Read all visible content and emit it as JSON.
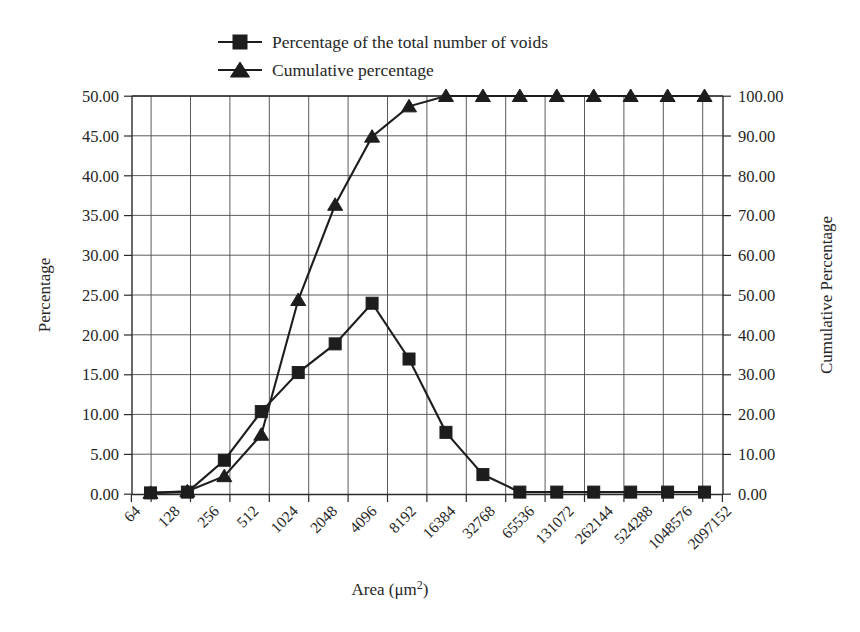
{
  "chart_data": {
    "type": "line",
    "title": "",
    "xlabel": "Area (μm²)",
    "ylabel": "Percentage",
    "y2label": "Cumulative Percentage",
    "categories": [
      "64",
      "128",
      "256",
      "512",
      "1024",
      "2048",
      "4096",
      "8192",
      "16384",
      "32768",
      "65536",
      "131072",
      "262144",
      "524288",
      "1048576",
      "2097152"
    ],
    "ylim": [
      0,
      50
    ],
    "y2lim": [
      0,
      100
    ],
    "yticks": [
      "0.00",
      "5.00",
      "10.00",
      "15.00",
      "20.00",
      "25.00",
      "30.00",
      "35.00",
      "40.00",
      "45.00",
      "50.00"
    ],
    "y2ticks": [
      "0.00",
      "10.00",
      "20.00",
      "30.00",
      "40.00",
      "50.00",
      "60.00",
      "70.00",
      "80.00",
      "90.00",
      "100.00"
    ],
    "grid": true,
    "legend_position": "top-left",
    "series": [
      {
        "name": "Percentage of the total number of voids",
        "marker": "square",
        "axis": "left",
        "values": [
          0.2,
          0.3,
          4.3,
          10.4,
          15.3,
          18.9,
          24.0,
          17.0,
          7.8,
          2.5,
          0.3,
          0.3,
          0.3,
          0.3,
          0.3,
          0.3
        ]
      },
      {
        "name": "Cumulative percentage",
        "marker": "triangle",
        "axis": "right",
        "values": [
          0.4,
          0.8,
          4.6,
          15.0,
          48.8,
          72.7,
          89.8,
          97.4,
          100.0,
          100.0,
          100.0,
          100.0,
          100.0,
          100.0,
          100.0,
          100.0
        ]
      }
    ]
  },
  "legend": {
    "items": [
      {
        "label": "Percentage of the total number of voids",
        "marker": "square"
      },
      {
        "label": "Cumulative percentage",
        "marker": "triangle"
      }
    ]
  },
  "axes": {
    "left_title": "Percentage",
    "right_title": "Cumulative Percentage",
    "bottom_title_main": "Area (μm",
    "bottom_title_sup": "2",
    "bottom_title_close": ")"
  },
  "colors": {
    "ink": "#1d1d1d",
    "grid": "#4a4a4a",
    "background": "#ffffff"
  }
}
